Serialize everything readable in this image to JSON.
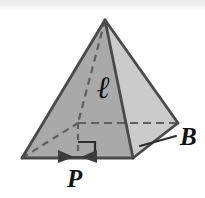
{
  "figure": {
    "name": "square-pyramid-lateral-area-diagram",
    "shape": "square pyramid",
    "background_color": "#ffffff",
    "scan_band_color": "#ededed",
    "colors": {
      "front_left_face": "#a9a9a9",
      "front_right_face": "#cfcfcf",
      "outline": "#4a4a4a",
      "hidden_edge": "#5a5a5a",
      "label_text": "#111111"
    },
    "labels": [
      {
        "id": "slant-height",
        "text": "ℓ",
        "meaning": "slant-height",
        "x": 97,
        "y": 72
      },
      {
        "id": "base-area",
        "text": "B",
        "meaning": "base-area",
        "x": 180,
        "y": 124
      },
      {
        "id": "base-perimeter",
        "text": "P",
        "meaning": "base-perimeter",
        "x": 67,
        "y": 166
      }
    ],
    "annotations": {
      "right_angle_marker": "right-angle-square-at-base-of-slant-height",
      "dimension_arrows": "double-headed-arrow-along-front-base-edge",
      "leader_line": "line-from-B-to-right-base-face",
      "hidden_edges": "dashed-back-edges-and-altitude"
    },
    "geometry": {
      "apex": [
        105,
        20
      ],
      "base_front": [
        78,
        158
      ],
      "base_left": [
        22,
        158
      ],
      "base_right": [
        133,
        158
      ],
      "base_back_visible_right": [
        178,
        123
      ],
      "base_back_hidden": [
        78,
        123
      ]
    }
  }
}
